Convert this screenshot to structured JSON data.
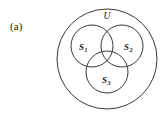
{
  "figure": {
    "panel_label": "(a)",
    "type": "venn-diagram",
    "universe": {
      "label": "U",
      "cx": 107,
      "cy": 59,
      "r": 50
    },
    "sets": [
      {
        "id": "S1",
        "base": "S",
        "subscript": "1",
        "cx": 92,
        "cy": 46,
        "r": 21,
        "label_x": 79,
        "label_y": 50
      },
      {
        "id": "S2",
        "base": "S",
        "subscript": "2",
        "cx": 122,
        "cy": 46,
        "r": 21,
        "label_x": 124,
        "label_y": 50
      },
      {
        "id": "S3",
        "base": "S",
        "subscript": "3",
        "cx": 107,
        "cy": 72,
        "r": 21,
        "label_x": 102,
        "label_y": 83
      }
    ],
    "universe_label_x": 107,
    "universe_label_y": 19,
    "colors": {
      "stroke": "#3a3a3a",
      "text": "#141414",
      "background": "#ffffff"
    }
  }
}
